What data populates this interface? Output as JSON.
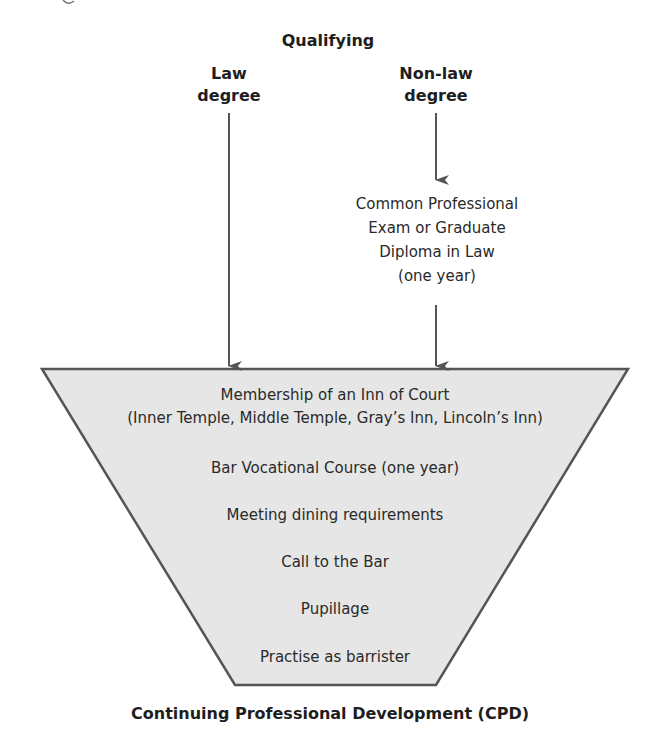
{
  "diagram": {
    "colors": {
      "funnel_fill": "#e6e6e6",
      "funnel_stroke": "#555555",
      "arrow": "#555555",
      "text": "#1e1e1e"
    },
    "header": {
      "title": "Qualifying"
    },
    "paths": [
      {
        "label_line1": "Law",
        "label_line2": "degree"
      },
      {
        "label_line1": "Non-law",
        "label_line2": "degree"
      }
    ],
    "conversion_course": {
      "line1": "Common Professional",
      "line2": "Exam or Graduate",
      "line3": "Diploma in Law",
      "line4": "(one year)"
    },
    "funnel_steps": [
      {
        "line1": "Membership of an Inn of Court",
        "line2": "(Inner Temple, Middle Temple, Gray’s Inn, Lincoln’s Inn)"
      },
      {
        "line1": "Bar Vocational Course (one year)"
      },
      {
        "line1": "Meeting dining requirements"
      },
      {
        "line1": "Call to the Bar"
      },
      {
        "line1": "Pupillage"
      },
      {
        "line1": "Practise as barrister"
      }
    ],
    "footer": {
      "label": "Continuing Professional Development (CPD)"
    }
  }
}
